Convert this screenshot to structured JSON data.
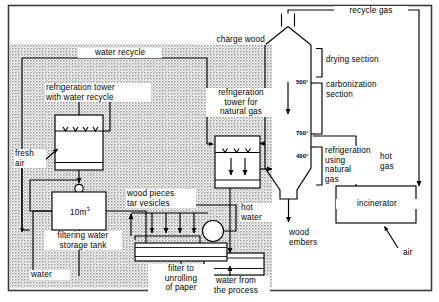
{
  "figure": {
    "type": "process-flow-diagram",
    "ink_color": "#000000",
    "background_color": "#ffffff",
    "shaded_zone_color": "#b0b0b0"
  },
  "labels": {
    "recycle_gas": "recycle gas",
    "charge_wood": "charge wood",
    "water_recycle": "water recycle",
    "refrigeration_tower_water": "refrigeration tower\nwith water recycle",
    "refrigeration_tower_natural_gas": "refrigeration\ntower for\nnatural gas",
    "drying_section": "drying section",
    "carbonization_section": "carbonization\nsection",
    "refrigeration_using_natural_gas": "refrigeration\nusing\nnatural\ngas",
    "hot_gas": "hot\ngas",
    "incinerator": "incinerator",
    "air_right": "air",
    "fresh_air": "fresh\nair",
    "tank_volume": "10m",
    "tank_volume_exponent": "3",
    "filtering_water_storage_tank": "filtering water\nstorage tank",
    "water_left": "water",
    "wood_pieces_tar_vesicles": "wood pieces\ntar vesicles",
    "filter_to_unrolling_of_paper": "filter to\nunrolling\nof paper",
    "hot_water": "hot\nwater",
    "water_from_the_process": "water from\nthe process",
    "wood_embers": "wood\nembers"
  },
  "temperatures": {
    "drying_to_carbonization": "500°",
    "carbonization_to_cooling": "700°",
    "cooling_zone": "400°"
  },
  "units": [
    {
      "name": "reactor-kiln",
      "sections": [
        "drying section",
        "carbonization section",
        "refrigeration using natural gas"
      ]
    },
    {
      "name": "refrigeration-tower-water-recycle"
    },
    {
      "name": "refrigeration-tower-natural-gas"
    },
    {
      "name": "filtering-water-storage-tank",
      "capacity": "10m3"
    },
    {
      "name": "paper-filter-unroll"
    },
    {
      "name": "process-water-basin"
    },
    {
      "name": "incinerator"
    }
  ],
  "streams": [
    "recycle gas",
    "charge wood",
    "water recycle",
    "fresh air",
    "water",
    "hot gas",
    "hot water",
    "air",
    "wood embers",
    "water from the process",
    "wood pieces tar vesicles"
  ]
}
